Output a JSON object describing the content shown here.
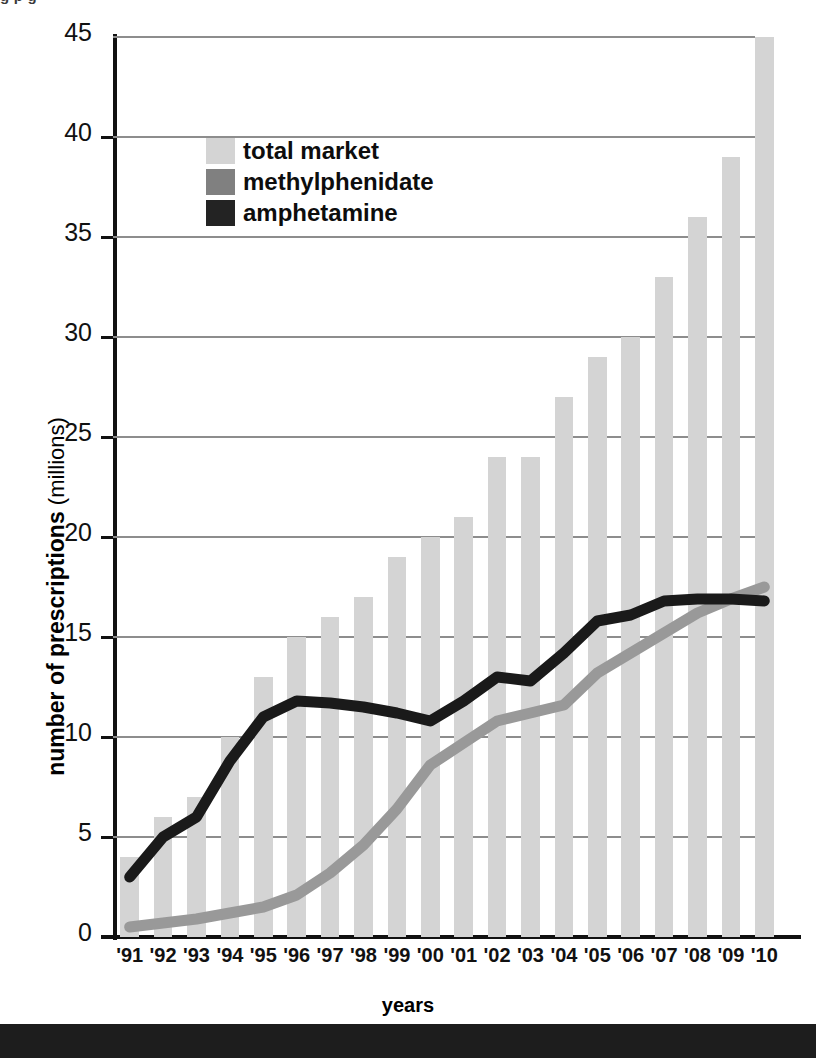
{
  "figure": {
    "top_cropped_text": "g p g",
    "xlabel": "years",
    "ylabel_strong": "number of prescriptions",
    "ylabel_light": " (millions)"
  },
  "legend": {
    "items": [
      {
        "label": "total market",
        "color": "#d4d4d4",
        "name": "legend-swatch-total-market"
      },
      {
        "label": "methylphenidate",
        "color": "#808080",
        "name": "legend-swatch-methylphenidate"
      },
      {
        "label": "amphetamine",
        "color": "#232323",
        "name": "legend-swatch-amphetamine"
      }
    ]
  },
  "colors": {
    "bar": "#d4d4d4",
    "methylphenidate": "#999999",
    "amphetamine": "#1a1a1a",
    "grid": "#8d8d8d",
    "axis": "#111111",
    "bottom_band": "#1d1d1d"
  },
  "chart_data": {
    "type": "bar",
    "title": "",
    "subtitle": "",
    "xlabel": "years",
    "ylabel": "number of prescriptions (millions)",
    "ylim": [
      0,
      45
    ],
    "yticks": [
      0,
      5,
      10,
      15,
      20,
      25,
      30,
      35,
      40,
      45
    ],
    "ytick_labels": [
      "0",
      "5",
      "10",
      "15",
      "20",
      "25",
      "30",
      "35",
      "40",
      "45"
    ],
    "grid": true,
    "grid_axis": "y",
    "legend_position": "upper-left-inside",
    "categories": [
      "'91",
      "'92",
      "'93",
      "'94",
      "'95",
      "'96",
      "'97",
      "'98",
      "'99",
      "'00",
      "'01",
      "'02",
      "'03",
      "'04",
      "'05",
      "'06",
      "'07",
      "'08",
      "'09",
      "'10"
    ],
    "series": [
      {
        "name": "total market",
        "type": "bar",
        "color": "#d4d4d4",
        "values": [
          4,
          6,
          7,
          10,
          13,
          15,
          16,
          17,
          19,
          20,
          21,
          24,
          24,
          27,
          29,
          30,
          33,
          36,
          39,
          45
        ]
      },
      {
        "name": "methylphenidate",
        "type": "line",
        "color": "#999999",
        "values": [
          0.5,
          0.7,
          0.9,
          1.2,
          1.5,
          2.1,
          3.2,
          4.6,
          6.4,
          8.6,
          9.7,
          10.8,
          11.2,
          11.6,
          13.2,
          14.2,
          15.2,
          16.2,
          16.9,
          17.5
        ]
      },
      {
        "name": "amphetamine",
        "type": "line",
        "color": "#1a1a1a",
        "values": [
          3.0,
          5.0,
          6.0,
          8.8,
          11.0,
          11.8,
          11.7,
          11.5,
          11.2,
          10.8,
          11.8,
          13.0,
          12.8,
          14.2,
          15.8,
          16.1,
          16.8,
          16.9,
          16.9,
          16.8
        ]
      }
    ]
  }
}
